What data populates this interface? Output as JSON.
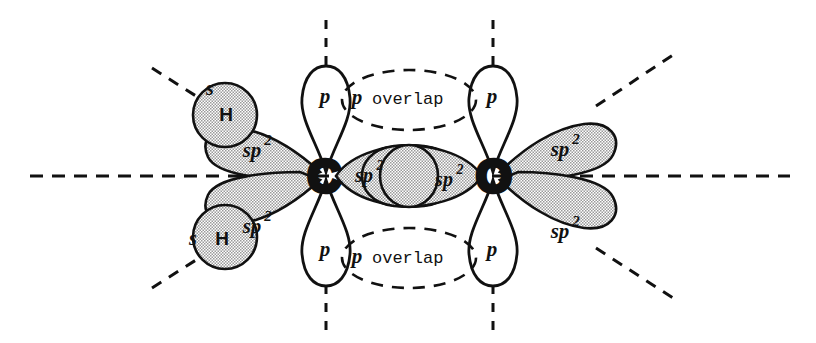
{
  "figure": {
    "background_color": "#ffffff",
    "line_color": "#111111",
    "lobe_fill_shaded": "#c9c9c9",
    "lobe_fill_empty": "#ffffff"
  },
  "atoms": [
    {
      "id": "carbon",
      "label": "C",
      "x": 324,
      "y": 176
    },
    {
      "id": "oxygen",
      "label": "O",
      "x": 494,
      "y": 176
    }
  ],
  "labels": {
    "p_orbital": "p",
    "sp2_base": "sp",
    "sp2_exponent": "2",
    "hydrogen": "H",
    "s_orbital": "s",
    "overlap_top": "p overlap",
    "overlap_bottom": "p overlap",
    "overlap_prefix": "p",
    "overlap_word": "overlap"
  },
  "orbitals": [
    {
      "name": "carbon-p-top",
      "type": "p",
      "atom": "carbon",
      "label": "p",
      "shaded": false,
      "direction": "up"
    },
    {
      "name": "carbon-p-bottom",
      "type": "p",
      "atom": "carbon",
      "label": "p",
      "shaded": false,
      "direction": "down"
    },
    {
      "name": "oxygen-p-top",
      "type": "p",
      "atom": "oxygen",
      "label": "p",
      "shaded": false,
      "direction": "up"
    },
    {
      "name": "oxygen-p-bottom",
      "type": "p",
      "atom": "oxygen",
      "label": "p",
      "shaded": false,
      "direction": "down"
    },
    {
      "name": "carbon-sp2-upper-left",
      "type": "sp2",
      "atom": "carbon",
      "label": "sp2",
      "shaded": true,
      "direction": "upper-left"
    },
    {
      "name": "carbon-sp2-lower-left",
      "type": "sp2",
      "atom": "carbon",
      "label": "sp2",
      "shaded": true,
      "direction": "lower-left"
    },
    {
      "name": "carbon-sp2-sigma",
      "type": "sp2",
      "atom": "carbon",
      "label": "sp2",
      "shaded": true,
      "direction": "right"
    },
    {
      "name": "oxygen-sp2-sigma",
      "type": "sp2",
      "atom": "oxygen",
      "label": "sp2",
      "shaded": true,
      "direction": "left"
    },
    {
      "name": "oxygen-sp2-upper-right",
      "type": "sp2",
      "atom": "oxygen",
      "label": "sp2",
      "shaded": true,
      "direction": "upper-right"
    },
    {
      "name": "oxygen-sp2-lower-right",
      "type": "sp2",
      "atom": "oxygen",
      "label": "sp2",
      "shaded": true,
      "direction": "lower-right"
    },
    {
      "name": "hydrogen-s-upper",
      "type": "s",
      "atom": "hydrogen",
      "label": "H",
      "shaded": true,
      "direction": "upper-left"
    },
    {
      "name": "hydrogen-s-lower",
      "type": "s",
      "atom": "hydrogen",
      "label": "H",
      "shaded": true,
      "direction": "lower-left"
    }
  ],
  "guides": {
    "horizontal_axis": true,
    "vertical_axes": 4,
    "diagonal_axes": 4
  }
}
